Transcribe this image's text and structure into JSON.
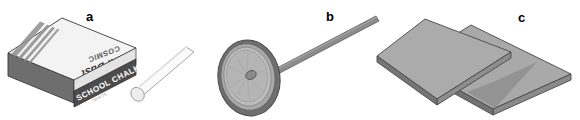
{
  "figure": {
    "background_color": "#ffffff",
    "width": 580,
    "height": 120,
    "caption": ""
  },
  "panels": [
    {
      "id": "a",
      "label": "a",
      "object_name": "chalk-box-with-chalk-stick",
      "box": {
        "front_band_text": "SCHOOL CHALK",
        "front_band_subtext": "WHITE",
        "top_brand_text": "COSMIC",
        "top_product_text": "Anti-Dust",
        "top_text_orientation": "rotated-180",
        "colors": {
          "top_face": "#f2f2f2",
          "front_band": "#4c4c4c",
          "front_lower": "#d8d8d8",
          "side_face": "#6e6e6e",
          "stripe": "#7a7a7a",
          "outline": "#3a3a3a",
          "band_text": "#ffffff"
        }
      },
      "chalk_stick": {
        "shape": "cylinder",
        "colors": {
          "body": "#fbfbfb",
          "end_cap": "#ededed",
          "outline": "#9a9a9a"
        }
      }
    },
    {
      "id": "b",
      "label": "b",
      "object_name": "chalkboard-duster-disc-on-rod",
      "disc": {
        "shape": "ellipse-concentric-rings",
        "ring_count": 3,
        "colors": {
          "rim": "#6f6f6f",
          "outer_ring": "#a8a8a8",
          "inner_ring": "#bdbdbd",
          "face": "#b5b5b5",
          "hub": "#8a8a8a",
          "outline": "#4f4f4f"
        }
      },
      "rod": {
        "shape": "straight-handle",
        "colors": {
          "body": "#8c8c8c",
          "highlight": "#a6a6a6",
          "outline": "#5a5a5a"
        }
      }
    },
    {
      "id": "c",
      "label": "c",
      "object_name": "two-overlapping-flat-plates",
      "plate_count": 2,
      "plates": {
        "shape": "parallelogram-slab",
        "colors": {
          "top_face": "#a9a9a9",
          "front_edge": "#8a8a8a",
          "side_edge": "#727272",
          "shadow_face": "#8f8f8f",
          "outline": "#4a4a4a"
        }
      }
    }
  ],
  "colors": {
    "background": "#ffffff",
    "label_text": "#000000",
    "dark_gray": "#4c4c4c",
    "mid_gray": "#a9a9a9",
    "light_gray": "#f2f2f2"
  }
}
